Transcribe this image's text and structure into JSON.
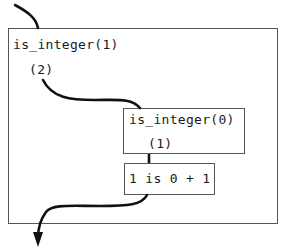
{
  "diagram": {
    "outer_frame": {
      "call_label": "is_integer(1)",
      "port_label": "(2)"
    },
    "inner_call_frame": {
      "call_label": "is_integer(0)",
      "port_label": "(1)"
    },
    "goal_box": {
      "label": "1 is 0 + 1"
    },
    "flow": {
      "entry": "arrow entering outer frame from top",
      "exit": "arrow leaving outer frame downward"
    },
    "colors": {
      "stroke": "#111111",
      "box_border": "#555555",
      "background": "#ffffff"
    }
  }
}
